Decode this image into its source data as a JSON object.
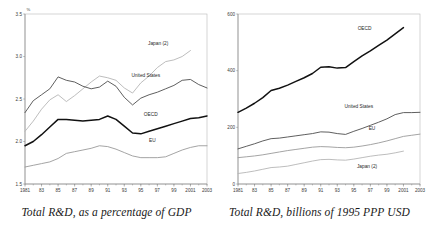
{
  "figure": {
    "panels": [
      {
        "id": "rnd-percent-gdp",
        "caption": "Total R&D, as a percentage of GDP",
        "unit_symbol": "%"
      },
      {
        "id": "rnd-billions-ppp",
        "caption": "Total R&D, billions of 1995 PPP USD",
        "unit_symbol": ""
      }
    ]
  },
  "colors": {
    "oecd": "#111111",
    "united_states": "#4d4d4d",
    "eu": "#9a9a9a",
    "japan": "#b5b5b5",
    "axis": "#8a8a8a",
    "frame": "#b9b9b9",
    "text": "#1f1f1f"
  },
  "chart_data": [
    {
      "type": "line",
      "title": "",
      "caption": "Total R&D, as a percentage of GDP",
      "xlabel": "",
      "ylabel": "%",
      "grid": false,
      "legend": "inline-labels",
      "x": [
        1981,
        1982,
        1983,
        1984,
        1985,
        1986,
        1987,
        1988,
        1989,
        1990,
        1991,
        1992,
        1993,
        1994,
        1995,
        1996,
        1997,
        1998,
        1999,
        2000,
        2001,
        2002,
        2003
      ],
      "xtick_labels": [
        "1981",
        "83",
        "85",
        "87",
        "89",
        "91",
        "93",
        "95",
        "97",
        "99",
        "2001",
        "2003"
      ],
      "xtick_values": [
        1981,
        1983,
        1985,
        1987,
        1989,
        1991,
        1993,
        1995,
        1997,
        1999,
        2001,
        2003
      ],
      "xlim": [
        1981,
        2003
      ],
      "ylim": [
        1.5,
        3.5
      ],
      "ytick_values": [
        1.5,
        2.0,
        2.5,
        3.0,
        3.5
      ],
      "ytick_labels": [
        "1.5",
        "2.0",
        "2.5",
        "3.0",
        "3.5"
      ],
      "series": [
        {
          "name": "Japan (2)",
          "color": "#b5b5b5",
          "width": 0.9,
          "label_x": 1997.1,
          "label_y": 3.13,
          "values": [
            2.12,
            2.24,
            2.38,
            2.49,
            2.55,
            2.47,
            2.54,
            2.62,
            2.7,
            2.77,
            2.75,
            2.72,
            2.63,
            2.57,
            2.69,
            2.77,
            2.87,
            2.94,
            2.96,
            3.0,
            3.07,
            null,
            null
          ]
        },
        {
          "name": "United States",
          "color": "#4d4d4d",
          "width": 0.9,
          "label_x": 1995.6,
          "label_y": 2.76,
          "values": [
            2.34,
            2.48,
            2.55,
            2.62,
            2.76,
            2.72,
            2.7,
            2.65,
            2.62,
            2.64,
            2.71,
            2.65,
            2.52,
            2.43,
            2.51,
            2.55,
            2.58,
            2.62,
            2.66,
            2.72,
            2.73,
            2.67,
            2.63
          ]
        },
        {
          "name": "OECD",
          "color": "#111111",
          "width": 1.5,
          "label_x": 1996.2,
          "label_y": 2.3,
          "values": [
            1.95,
            2.0,
            2.08,
            2.17,
            2.26,
            2.26,
            2.25,
            2.24,
            2.25,
            2.26,
            2.3,
            2.26,
            2.18,
            2.1,
            2.09,
            2.12,
            2.15,
            2.18,
            2.21,
            2.24,
            2.27,
            2.28,
            2.3
          ]
        },
        {
          "name": "EU",
          "color": "#9a9a9a",
          "width": 0.9,
          "label_x": 1996.4,
          "label_y": 1.99,
          "values": [
            1.7,
            1.72,
            1.74,
            1.76,
            1.8,
            1.86,
            1.88,
            1.9,
            1.92,
            1.95,
            1.94,
            1.91,
            1.87,
            1.83,
            1.81,
            1.81,
            1.81,
            1.82,
            1.86,
            1.9,
            1.93,
            1.95,
            1.95
          ]
        }
      ]
    },
    {
      "type": "line",
      "title": "",
      "caption": "Total R&D, billions of 1995 PPP USD",
      "xlabel": "",
      "ylabel": "",
      "grid": false,
      "legend": "inline-labels",
      "x": [
        1981,
        1982,
        1983,
        1984,
        1985,
        1986,
        1987,
        1988,
        1989,
        1990,
        1991,
        1992,
        1993,
        1994,
        1995,
        1996,
        1997,
        1998,
        1999,
        2000,
        2001,
        2002,
        2003
      ],
      "xtick_labels": [
        "1981",
        "83",
        "85",
        "87",
        "89",
        "91",
        "93",
        "95",
        "97",
        "99",
        "2001",
        "2003"
      ],
      "xtick_values": [
        1981,
        1983,
        1985,
        1987,
        1989,
        1991,
        1993,
        1995,
        1997,
        1999,
        2001,
        2003
      ],
      "xlim": [
        1981,
        2003
      ],
      "ylim": [
        0,
        600
      ],
      "ytick_values": [
        0,
        200,
        400,
        600
      ],
      "ytick_labels": [
        "0",
        "200",
        "400",
        "600"
      ],
      "series": [
        {
          "name": "OECD",
          "color": "#111111",
          "width": 1.5,
          "label_x": 1996.3,
          "label_y": 545,
          "values": [
            253,
            268,
            285,
            305,
            330,
            338,
            349,
            362,
            375,
            390,
            412,
            414,
            409,
            411,
            432,
            452,
            470,
            489,
            508,
            530,
            552,
            null,
            null
          ]
        },
        {
          "name": "United States",
          "color": "#4d4d4d",
          "width": 0.9,
          "label_x": 1995.6,
          "label_y": 268,
          "values": [
            124,
            133,
            142,
            152,
            160,
            162,
            166,
            170,
            174,
            178,
            184,
            183,
            178,
            175,
            186,
            196,
            207,
            218,
            230,
            245,
            252,
            252,
            253
          ]
        },
        {
          "name": "EU",
          "color": "#9a9a9a",
          "width": 0.9,
          "label_x": 1997.2,
          "label_y": 192,
          "values": [
            93,
            96,
            99,
            103,
            108,
            113,
            118,
            122,
            126,
            130,
            132,
            131,
            129,
            128,
            130,
            134,
            139,
            145,
            152,
            160,
            168,
            172,
            176
          ]
        },
        {
          "name": "Japan (2)",
          "color": "#b5b5b5",
          "width": 0.9,
          "label_x": 1996.6,
          "label_y": 57,
          "values": [
            37,
            41,
            46,
            52,
            58,
            60,
            63,
            69,
            75,
            81,
            86,
            87,
            85,
            84,
            88,
            93,
            98,
            102,
            105,
            110,
            116,
            null,
            null
          ]
        }
      ]
    }
  ]
}
